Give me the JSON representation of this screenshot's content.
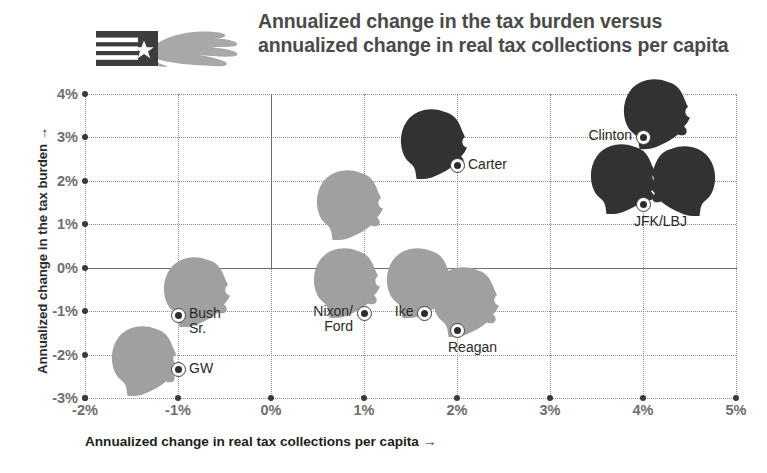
{
  "title": "Annualized change in the tax burden versus annualized change in real tax collections per capita",
  "logo": {
    "name": "flag-and-hand-logo",
    "flag_color": "#3d3d3d",
    "hand_color": "#a8a8a8",
    "star_color": "#ffffff"
  },
  "chart_data": {
    "type": "scatter",
    "title": "Annualized change in the tax burden versus annualized change in real tax collections per capita",
    "xlabel": "Annualized change in real tax collections per capita →",
    "ylabel": "Annualized change in the tax burden →",
    "xlim": [
      -2,
      5
    ],
    "ylim": [
      -3,
      4
    ],
    "xticks": [
      "-2%",
      "-1%",
      "0%",
      "1%",
      "2%",
      "3%",
      "4%",
      "5%"
    ],
    "xtick_values": [
      -2,
      -1,
      0,
      1,
      2,
      3,
      4,
      5
    ],
    "yticks": [
      "4%",
      "3%",
      "2%",
      "1%",
      "0%",
      "-1%",
      "-2%",
      "-3%"
    ],
    "ytick_values": [
      4,
      3,
      2,
      1,
      0,
      -1,
      -2,
      -3
    ],
    "grid": true,
    "legend": false,
    "zero_lines": {
      "x": 0,
      "y": 0
    },
    "points": [
      {
        "label": "GW",
        "x": -1.0,
        "y": -2.35,
        "tone": "light",
        "label_pos": "right"
      },
      {
        "label": "Bush Sr.",
        "x": -1.0,
        "y": -1.1,
        "tone": "light",
        "label_pos": "right"
      },
      {
        "label": "Nixon/\nFord",
        "x": 1.0,
        "y": -1.05,
        "tone": "light",
        "label_pos": "left"
      },
      {
        "label": "Ike",
        "x": 1.65,
        "y": -1.05,
        "tone": "light",
        "label_pos": "left"
      },
      {
        "label": "Reagan",
        "x": 2.0,
        "y": -1.45,
        "tone": "light",
        "label_pos": "below"
      },
      {
        "label": "Carter",
        "x": 2.0,
        "y": 2.35,
        "tone": "dark",
        "label_pos": "right"
      },
      {
        "label": "Clinton",
        "x": 4.0,
        "y": 3.0,
        "tone": "dark",
        "label_pos": "left"
      },
      {
        "label": "JFK/LBJ",
        "x": 4.0,
        "y": 1.45,
        "tone": "dark",
        "label_pos": "below"
      }
    ],
    "silhouettes": [
      {
        "for": "GW",
        "x": -1.35,
        "y": -2.15,
        "tone": "light"
      },
      {
        "for": "Bush Sr.",
        "x": -0.8,
        "y": -0.55,
        "tone": "light"
      },
      {
        "for": "Nixon/Ford",
        "x": 0.82,
        "y": -0.35,
        "tone": "light"
      },
      {
        "for": "Nixon-upper",
        "x": 0.85,
        "y": 1.45,
        "tone": "light"
      },
      {
        "for": "Ike",
        "x": 1.6,
        "y": -0.35,
        "tone": "light"
      },
      {
        "for": "Reagan",
        "x": 2.1,
        "y": -0.8,
        "tone": "light"
      },
      {
        "for": "Carter",
        "x": 1.75,
        "y": 2.85,
        "tone": "dark"
      },
      {
        "for": "Clinton",
        "x": 4.15,
        "y": 3.55,
        "tone": "dark"
      },
      {
        "for": "JFK",
        "x": 3.8,
        "y": 2.05,
        "tone": "dark"
      },
      {
        "for": "LBJ",
        "x": 4.42,
        "y": 2.0,
        "tone": "dark"
      }
    ],
    "colors": {
      "light_silhouette": "#a0a0a0",
      "dark_silhouette": "#323232",
      "grid": "#8d8d8d",
      "axis": "#6f6f6f",
      "tick_text": "#6e6e6e",
      "title_text": "#4a4a4a"
    }
  }
}
